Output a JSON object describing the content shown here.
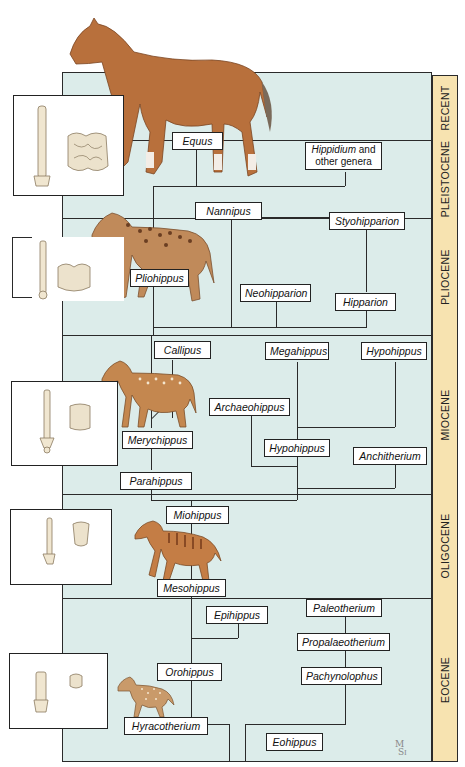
{
  "diagram": {
    "colors": {
      "background_band": "#dcecea",
      "epoch_column": "#f7e3b0",
      "line": "#2a2a2a",
      "horse_modern": "#b8703c",
      "horse_pliohippus": "#c08a5a",
      "horse_merychippus": "#c4874f",
      "horse_mesohippus": "#c47d45",
      "horse_hyracotherium": "#c99a6a"
    },
    "epochs": [
      {
        "label": "RECENT"
      },
      {
        "label": "PLEISTOCENE"
      },
      {
        "label": "PLIOCENE"
      },
      {
        "label": "MIOCENE"
      },
      {
        "label": "OLIGOCENE"
      },
      {
        "label": "EOCENE"
      }
    ],
    "genera": {
      "equus": "Equus",
      "hippidium": "Hippidium",
      "hippidium_suffix": " and",
      "hippidium_line2": "other genera",
      "nannipus": "Nannipus",
      "styohipparion": "Styohipparion",
      "pliohippus": "Pliohippus",
      "neohipparion": "Neohipparion",
      "hipparion": "Hipparion",
      "callipus": "Callipus",
      "megahippus": "Megahippus",
      "hypohippus_top": "Hypohippus",
      "archaeohippus": "Archaeohippus",
      "merychippus": "Merychippus",
      "hypohippus": "Hypohippus",
      "anchitherium": "Anchitherium",
      "parahippus": "Parahippus",
      "miohippus": "Miohippus",
      "mesohippus": "Mesohippus",
      "epihippus": "Epihippus",
      "paleotherium": "Paleotherium",
      "propalaeotherium": "Propalaeotherium",
      "orohippus": "Orohippus",
      "pachynolophus": "Pachynolophus",
      "hyracotherium": "Hyracotherium",
      "eohippus": "Eohippus"
    },
    "fossil_panels": [
      {
        "name": "equus-foot-and-tooth"
      },
      {
        "name": "pliohippus-foot-and-tooth"
      },
      {
        "name": "merychippus-foot-and-tooth"
      },
      {
        "name": "mesohippus-foot-and-tooth"
      },
      {
        "name": "hyracotherium-foot-and-tooth"
      }
    ],
    "signature": {
      "line1": "M",
      "line2": "S",
      "line3": "I"
    }
  }
}
